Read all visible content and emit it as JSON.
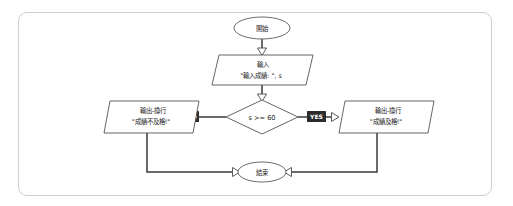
{
  "diagram": {
    "frame": {
      "border_color": "#cfcfcf",
      "background": "#ffffff"
    },
    "colors": {
      "shape_stroke": "#555555",
      "shape_fill": "#ffffff",
      "edge": "#3a3a3a",
      "badge_fill": "#2b2b2b",
      "badge_text": "#ffffff",
      "text": "#222222"
    },
    "nodes": [
      {
        "id": "start",
        "shape": "ellipse",
        "label": "開始"
      },
      {
        "id": "input",
        "shape": "parallelogram",
        "line1": "輸入",
        "line2": "\"輸入成績: \", s"
      },
      {
        "id": "decision",
        "shape": "diamond",
        "label": "s >= 60"
      },
      {
        "id": "fail",
        "shape": "parallelogram",
        "line1": "輸出-換行",
        "line2": "\"成績不及格!\""
      },
      {
        "id": "pass",
        "shape": "parallelogram",
        "line1": "輸出-換行",
        "line2": "\"成績及格!\""
      },
      {
        "id": "end",
        "shape": "ellipse",
        "label": "結束"
      }
    ],
    "branches": {
      "no": "NO",
      "yes": "YES"
    }
  }
}
